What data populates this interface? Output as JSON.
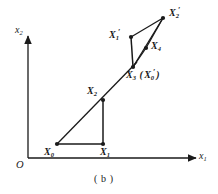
{
  "figure": {
    "caption": "( b )",
    "origin_label": "O",
    "axes": {
      "x_axis_label": {
        "base": "x",
        "sub": "1"
      },
      "y_axis_label": {
        "base": "x",
        "sub": "2"
      }
    },
    "stroke_color": "#1a1a1a",
    "background_color": "#ffffff"
  },
  "points": [
    {
      "id": "X0",
      "label_base": "X",
      "label_sub": "0",
      "label_prime": "",
      "x": 57,
      "y": 144,
      "label_x": 44,
      "label_y": 148
    },
    {
      "id": "X1",
      "label_base": "X",
      "label_sub": "1",
      "label_prime": "",
      "x": 103,
      "y": 144,
      "label_x": 100,
      "label_y": 148
    },
    {
      "id": "X2",
      "label_base": "X",
      "label_sub": "2",
      "label_prime": "",
      "x": 103,
      "y": 100,
      "label_x": 88,
      "label_y": 88
    },
    {
      "id": "X3",
      "label_base": "X",
      "label_sub": "3",
      "label_prime": "",
      "x": 133,
      "y": 67,
      "label_x": 129,
      "label_y": 72
    },
    {
      "id": "X4",
      "label_base": "X",
      "label_sub": "4",
      "label_prime": "",
      "x": 146,
      "y": 48,
      "label_x": 151,
      "label_y": 43
    },
    {
      "id": "X1prime",
      "label_base": "X",
      "label_sub": "1",
      "label_prime": "′",
      "x": 131,
      "y": 37,
      "label_x": 110,
      "label_y": 32
    },
    {
      "id": "X2prime",
      "label_base": "X",
      "label_sub": "2",
      "label_prime": "′",
      "x": 163,
      "y": 18,
      "label_x": 168,
      "label_y": 10
    }
  ],
  "composite_labels": [
    {
      "id": "X3-X0prime",
      "text_parts": [
        "X",
        "3",
        " (",
        "X",
        "0",
        "′",
        ")"
      ]
    }
  ],
  "segments": [
    {
      "from": "X0",
      "to": "X1"
    },
    {
      "from": "X1",
      "to": "X2"
    },
    {
      "from": "X0",
      "to": "X3"
    },
    {
      "from": "X3",
      "to": "X1prime"
    },
    {
      "from": "X3",
      "to": "X4"
    },
    {
      "from": "X3",
      "to": "X2prime"
    },
    {
      "from": "X1prime",
      "to": "X2prime"
    },
    {
      "from": "X4",
      "to": "X2prime"
    }
  ]
}
